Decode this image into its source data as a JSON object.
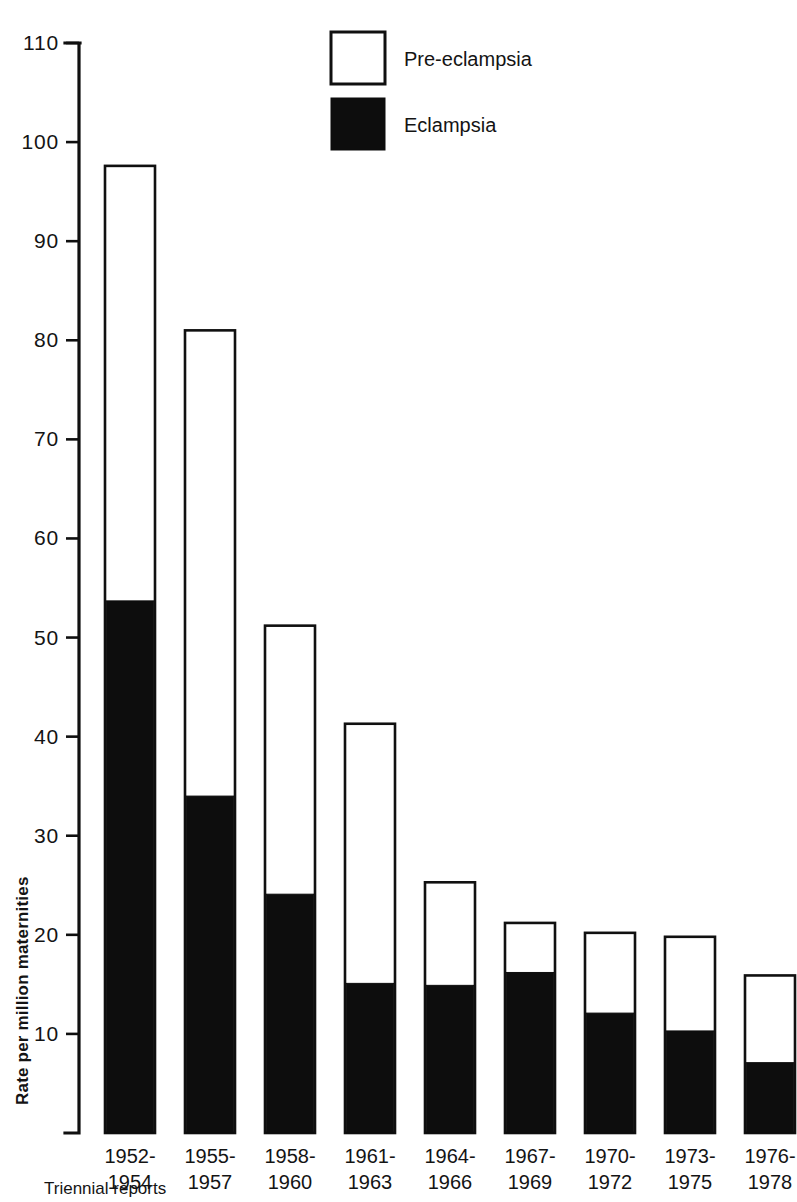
{
  "chart_data": {
    "type": "bar",
    "stacked": true,
    "title": "",
    "subtitle": "",
    "xlabel": "Triennial reports",
    "ylabel": "Rate per million maternities",
    "ylim": [
      0,
      110
    ],
    "ytick_step": 10,
    "ytick_labels": [
      "110",
      "100",
      "90",
      "80",
      "70",
      "60",
      "50",
      "40",
      "30",
      "20",
      "10"
    ],
    "ytick_values": [
      110,
      100,
      90,
      80,
      70,
      60,
      50,
      40,
      30,
      20,
      10
    ],
    "grid": false,
    "legend_position": "top-center",
    "categories": [
      "1952-\n1954",
      "1955-\n1957",
      "1958-\n1960",
      "1961-\n1963",
      "1964-\n1966",
      "1967-\n1969",
      "1970-\n1972",
      "1973-\n1975",
      "1976-\n1978"
    ],
    "category_lines": [
      [
        "1952-",
        "1954"
      ],
      [
        "1955-",
        "1957"
      ],
      [
        "1958-",
        "1960"
      ],
      [
        "1961-",
        "1963"
      ],
      [
        "1964-",
        "1966"
      ],
      [
        "1967-",
        "1969"
      ],
      [
        "1970-",
        "1972"
      ],
      [
        "1973-",
        "1975"
      ],
      [
        "1976-",
        "1978"
      ]
    ],
    "series": [
      {
        "name": "Eclampsia",
        "color": "#0d0d0d",
        "style": "filled",
        "values": [
          53.7,
          34.0,
          24.1,
          15.1,
          14.9,
          16.2,
          12.1,
          10.3,
          7.1
        ]
      },
      {
        "name": "Pre-eclampsia",
        "color": "#ffffff",
        "style": "open",
        "values": [
          43.9,
          47.0,
          27.1,
          26.2,
          10.4,
          5.0,
          8.1,
          9.5,
          8.8
        ]
      }
    ],
    "totals": [
      97.6,
      81.0,
      51.2,
      41.3,
      25.3,
      21.2,
      20.2,
      19.8,
      15.9
    ],
    "legend": [
      {
        "label": "Pre-eclampsia",
        "swatch": "open",
        "color": "#ffffff"
      },
      {
        "label": "Eclampsia",
        "swatch": "solid",
        "color": "#0d0d0d"
      }
    ]
  },
  "colors": {
    "background": "#ffffff",
    "ink": "#101010",
    "fill_dark": "#0d0d0d",
    "fill_light": "#ffffff"
  }
}
